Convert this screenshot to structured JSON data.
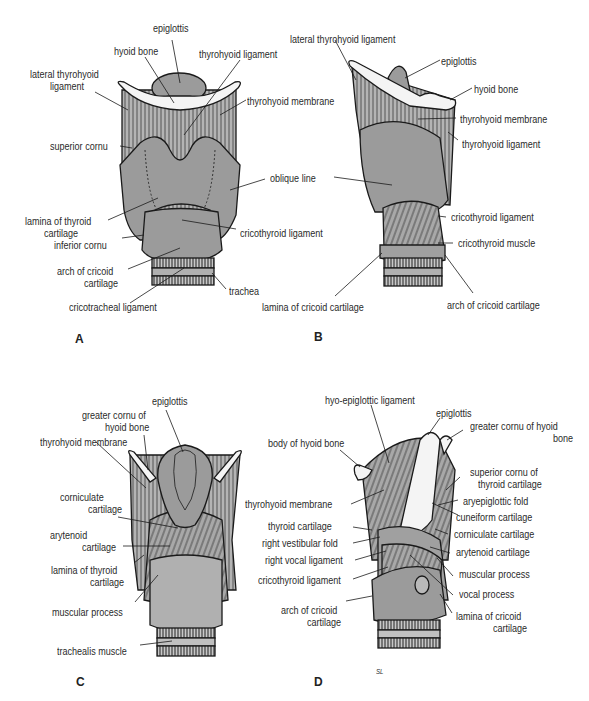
{
  "figure": {
    "colors": {
      "fill": "#9b9b9b",
      "fill_light": "#b9b9b9",
      "bone": "#f4f4f4",
      "line": "#1a1a1a",
      "text": "#2a2a2a"
    },
    "panels": [
      {
        "letter": "A",
        "labels": {
          "epiglottis": "epiglottis",
          "hyoid_bone": "hyoid bone",
          "thyrohyoid_ligament": "thyrohyoid ligament",
          "lateral_thyrohyoid_ligament_1": "lateral thyrohyoid",
          "lateral_thyrohyoid_ligament_2": "ligament",
          "thyrohyoid_membrane": "thyrohyoid membrane",
          "superior_cornu": "superior cornu",
          "oblique_line": "oblique line",
          "lamina_thyroid_1": "lamina of thyroid",
          "lamina_thyroid_2": "cartilage",
          "inferior_cornu": "inferior cornu",
          "cricothyroid_ligament": "cricothyroid ligament",
          "arch_cricoid_1": "arch of cricoid",
          "arch_cricoid_2": "cartilage",
          "trachea": "trachea",
          "cricotracheal_ligament": "cricotracheal ligament"
        }
      },
      {
        "letter": "B",
        "labels": {
          "lateral_thyrohyoid_ligament": "lateral thyrohyoid ligament",
          "epiglottis": "epiglottis",
          "hyoid_bone": "hyoid bone",
          "thyrohyoid_membrane": "thyrohyoid membrane",
          "thyrohyoid_ligament": "thyrohyoid ligament",
          "cricothyroid_ligament": "cricothyroid ligament",
          "cricothyroid_muscle": "cricothyroid muscle",
          "lamina_cricoid": "lamina of cricoid cartilage",
          "arch_cricoid": "arch of cricoid cartilage"
        }
      },
      {
        "letter": "C",
        "labels": {
          "epiglottis": "epiglottis",
          "greater_cornu_1": "greater cornu of",
          "greater_cornu_2": "hyoid bone",
          "thyrohyoid_membrane": "thyrohyoid membrane",
          "corniculate_1": "corniculate",
          "corniculate_2": "cartilage",
          "arytenoid_1": "arytenoid",
          "arytenoid_2": "cartilage",
          "lamina_thyroid_1": "lamina of thyroid",
          "lamina_thyroid_2": "cartilage",
          "muscular_process": "muscular process",
          "trachealis_muscle": "trachealis muscle"
        }
      },
      {
        "letter": "D",
        "signature": "SL",
        "labels": {
          "hyo_epiglottic_ligament": "hyo-epiglottic ligament",
          "epiglottis": "epiglottis",
          "greater_cornu_1": "greater cornu of hyoid",
          "greater_cornu_2": "bone",
          "body_hyoid": "body of hyoid bone",
          "superior_cornu_1": "superior cornu of",
          "superior_cornu_2": "thyroid cartilage",
          "aryepiglottic_fold": "aryepiglottic fold",
          "thyrohyoid_membrane": "thyrohyoid membrane",
          "cuneiform_cartilage": "cuneiform cartilage",
          "thyroid_cartilage": "thyroid cartilage",
          "corniculate_cartilage": "corniculate cartilage",
          "right_vestibular_fold": "right vestibular fold",
          "arytenoid_cartilage": "arytenoid cartilage",
          "right_vocal_ligament": "right vocal ligament",
          "cricothyroid_ligament": "cricothyroid ligament",
          "muscular_process": "muscular process",
          "vocal_process": "vocal process",
          "arch_cricoid_1": "arch of cricoid",
          "arch_cricoid_2": "cartilage",
          "lamina_cricoid_1": "lamina of cricoid",
          "lamina_cricoid_2": "cartilage"
        }
      }
    ]
  }
}
